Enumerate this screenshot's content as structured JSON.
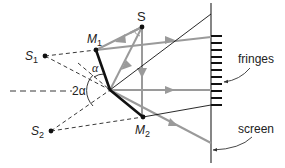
{
  "figure": {
    "labels": {
      "source": "S",
      "mirror1": "M",
      "mirror1_sub": "1",
      "mirror2": "M",
      "mirror2_sub": "2",
      "virtual_source1": "S",
      "virtual_source1_sub": "1",
      "virtual_source2": "S",
      "virtual_source2_sub": "2",
      "angle_alpha": "α",
      "angle_2alpha": "2α",
      "fringes": "fringes",
      "screen": "screen"
    },
    "colors": {
      "ray": "#9a9a9a",
      "mirror": "#111111",
      "construction": "#222222",
      "screen": "#444444"
    },
    "fringe_count": 11
  }
}
